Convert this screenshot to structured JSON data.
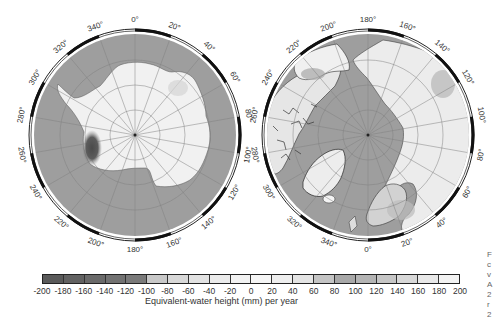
{
  "chart_data": [
    {
      "type": "heatmap",
      "title": "Antarctica (South polar stereographic)",
      "projection": "polar-south",
      "longitude_labels": [
        "0°",
        "20°",
        "40°",
        "60°",
        "80°",
        "100°",
        "120°",
        "140°",
        "160°",
        "180°",
        "200°",
        "220°",
        "240°",
        "260°",
        "280°",
        "300°",
        "320°",
        "340°"
      ],
      "features": [
        {
          "region": "East/West Antarctic interior",
          "value_range_mm_per_year": [
            -20,
            20
          ]
        },
        {
          "region": "Amundsen Sea sector (~250-260°)",
          "value_range_mm_per_year": [
            -180,
            -120
          ]
        },
        {
          "region": "Ocean (masked)",
          "value": "masked"
        }
      ]
    },
    {
      "type": "heatmap",
      "title": "Arctic (North polar stereographic)",
      "projection": "polar-north",
      "longitude_labels": [
        "180°",
        "160°",
        "140°",
        "120°",
        "100°",
        "80°",
        "60°",
        "40°",
        "20°",
        "0°",
        "340°",
        "320°",
        "300°",
        "280°",
        "260°",
        "240°",
        "220°",
        "200°"
      ],
      "features": [
        {
          "region": "Greenland",
          "value_range_mm_per_year": [
            0,
            40
          ]
        },
        {
          "region": "Alaska coast (~210-220°)",
          "value_range_mm_per_year": [
            -120,
            -80
          ]
        },
        {
          "region": "Siberia (~120-130°)",
          "value_range_mm_per_year": [
            60,
            100
          ]
        },
        {
          "region": "Fennoscandia",
          "value_range_mm_per_year": [
            60,
            120
          ]
        },
        {
          "region": "Ocean (masked)",
          "value": "masked"
        }
      ]
    },
    {
      "type": "colorbar",
      "xlabel": "Equivalent-water height (mm) per year",
      "ticks": [
        -200,
        -180,
        -160,
        -140,
        -120,
        -100,
        -80,
        -60,
        -40,
        -20,
        0,
        20,
        40,
        60,
        80,
        100,
        120,
        140,
        160,
        180,
        200
      ],
      "range": [
        -200,
        200
      ],
      "segment_colors": [
        "#5a5a5a",
        "#626262",
        "#6a6a6a",
        "#727272",
        "#7a7a7a",
        "#c8c8c8",
        "#d8d8d8",
        "#e2e2e2",
        "#ebebeb",
        "#f2f2f2",
        "#f5f5f5",
        "#eeeeee",
        "#e4e4e4",
        "#c4c4c4",
        "#a8a8a8",
        "#b4b4b4",
        "#c6c6c6",
        "#d8d8d8",
        "#e8e8e8",
        "#f2f2f2"
      ]
    }
  ],
  "colors": {
    "ocean": "#9e9e9e",
    "land_light": "#f1f1f1",
    "frame": "#111111",
    "grid": "#7d7d7d",
    "neg_anomaly": "#555555"
  },
  "side_text_fragments": [
    "F",
    "c",
    "v",
    "A",
    "2",
    "r",
    "2"
  ],
  "labels": {
    "south": {
      "0": "0°",
      "20": "20°",
      "40": "40°",
      "60": "60°",
      "80": "80°",
      "100": "100°",
      "120": "120°",
      "140": "140°",
      "160": "160°",
      "180": "180°",
      "200": "200°",
      "220": "220°",
      "240": "240°",
      "260": "260°",
      "280": "280°",
      "300": "300°",
      "320": "320°",
      "340": "340°"
    },
    "colorbar_title": "Equivalent-water height (mm) per year",
    "tick_labels": [
      "-200",
      "-180",
      "-160",
      "-140",
      "-120",
      "-100",
      "-80",
      "-60",
      "-40",
      "-20",
      "0",
      "20",
      "40",
      "60",
      "80",
      "100",
      "120",
      "140",
      "160",
      "180",
      "200"
    ]
  }
}
